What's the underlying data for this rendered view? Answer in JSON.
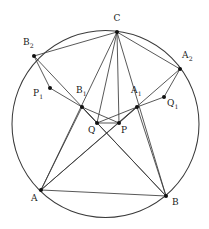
{
  "figure": {
    "background_color": "#ffffff",
    "stroke_color": "#3a3a3a",
    "point_color": "#111111",
    "width": 209,
    "height": 229
  },
  "circumcircle": {
    "name": "circumcircle",
    "cx": 105.5,
    "cy": 124.0,
    "r": 93.5
  },
  "points": [
    {
      "id": "C",
      "label": "C",
      "sub": "",
      "x": 117.0,
      "y": 32.0,
      "lx": 113.5,
      "ly": 14.0
    },
    {
      "id": "B2",
      "label": "B",
      "sub": "2",
      "x": 34.0,
      "y": 56.0,
      "lx": 23.0,
      "ly": 38.0
    },
    {
      "id": "A2",
      "label": "A",
      "sub": "2",
      "x": 180.0,
      "y": 69.0,
      "lx": 182.0,
      "ly": 51.0
    },
    {
      "id": "P1",
      "label": "P",
      "sub": "1",
      "x": 50.0,
      "y": 88.0,
      "lx": 33.0,
      "ly": 89.0
    },
    {
      "id": "B1",
      "label": "B",
      "sub": "1",
      "x": 82.0,
      "y": 107.0,
      "lx": 76.0,
      "ly": 86.0
    },
    {
      "id": "A1",
      "label": "A",
      "sub": "1",
      "x": 137.0,
      "y": 107.0,
      "lx": 131.0,
      "ly": 86.0
    },
    {
      "id": "Q1",
      "label": "Q",
      "sub": "1",
      "x": 164.0,
      "y": 97.0,
      "lx": 167.0,
      "ly": 99.0
    },
    {
      "id": "Q",
      "label": "Q",
      "sub": "",
      "x": 97.0,
      "y": 123.0,
      "lx": 88.0,
      "ly": 126.0
    },
    {
      "id": "P",
      "label": "P",
      "sub": "",
      "x": 119.0,
      "y": 123.0,
      "lx": 121.0,
      "ly": 126.0
    },
    {
      "id": "A",
      "label": "A",
      "sub": "",
      "x": 41.0,
      "y": 190.0,
      "lx": 31.0,
      "ly": 194.0
    },
    {
      "id": "B",
      "label": "B",
      "sub": "",
      "x": 166.0,
      "y": 196.0,
      "lx": 172.0,
      "ly": 198.0
    }
  ],
  "segments": [
    {
      "name": "side-AB",
      "from": "A",
      "to": "B"
    },
    {
      "name": "cevian-C-A",
      "from": "C",
      "to": "A"
    },
    {
      "name": "cevian-C-B",
      "from": "C",
      "to": "B"
    },
    {
      "name": "cevian-C-Q",
      "from": "C",
      "to": "Q"
    },
    {
      "name": "cevian-C-P",
      "from": "C",
      "to": "P"
    },
    {
      "name": "cevian-C-B2",
      "from": "C",
      "to": "B2"
    },
    {
      "name": "cevian-C-A2",
      "from": "C",
      "to": "A2"
    },
    {
      "name": "cevian-A-A1",
      "from": "A",
      "to": "A1"
    },
    {
      "name": "cevian-A-B1",
      "from": "A",
      "to": "B1"
    },
    {
      "name": "cevian-A-A2",
      "from": "A",
      "to": "A2"
    },
    {
      "name": "cevian-B-B1",
      "from": "B",
      "to": "B1"
    },
    {
      "name": "cevian-B-A1",
      "from": "B",
      "to": "A1"
    },
    {
      "name": "cevian-B-B2",
      "from": "B",
      "to": "B2"
    },
    {
      "name": "segment-QP",
      "from": "Q",
      "to": "P"
    },
    {
      "name": "segment-B1-P1",
      "from": "B1",
      "to": "P1"
    },
    {
      "name": "segment-A1-Q1",
      "from": "A1",
      "to": "Q1"
    },
    {
      "name": "segment-B1-Q",
      "from": "B1",
      "to": "Q"
    },
    {
      "name": "segment-A1-P",
      "from": "A1",
      "to": "P"
    },
    {
      "name": "segment-B1-P",
      "from": "B1",
      "to": "P"
    },
    {
      "name": "segment-A1-Q",
      "from": "A1",
      "to": "Q"
    },
    {
      "name": "segment-B2-P1",
      "from": "B2",
      "to": "P1"
    },
    {
      "name": "segment-A2-Q1",
      "from": "A2",
      "to": "Q1"
    }
  ]
}
